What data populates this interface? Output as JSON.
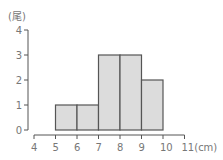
{
  "chart_data": {
    "type": "bar",
    "subtype": "histogram",
    "title": "",
    "ylabel": "(尾)",
    "xlabel": "(cm)",
    "x_ticks": [
      4,
      5,
      6,
      7,
      8,
      9,
      10,
      11
    ],
    "x_tick_labels": [
      "4",
      "5",
      "6",
      "7",
      "8",
      "9",
      "10",
      "11(cm)"
    ],
    "y_ticks": [
      0,
      1,
      2,
      3,
      4
    ],
    "y_tick_labels": [
      "0",
      "1",
      "2",
      "3",
      "4"
    ],
    "ylim": [
      0,
      4
    ],
    "xlim": [
      4,
      11
    ],
    "bins": [
      {
        "from": 5,
        "to": 6,
        "value": 1
      },
      {
        "from": 6,
        "to": 7,
        "value": 1
      },
      {
        "from": 7,
        "to": 8,
        "value": 3
      },
      {
        "from": 8,
        "to": 9,
        "value": 3
      },
      {
        "from": 9,
        "to": 10,
        "value": 2
      }
    ],
    "categories": [
      "5-6",
      "6-7",
      "7-8",
      "8-9",
      "9-10"
    ],
    "values": [
      1,
      1,
      3,
      3,
      2
    ],
    "grid": false,
    "colors": {
      "bar_fill": "#dcdcdc",
      "bar_stroke": "#555555",
      "axis": "#555555",
      "text": "#777777"
    }
  }
}
